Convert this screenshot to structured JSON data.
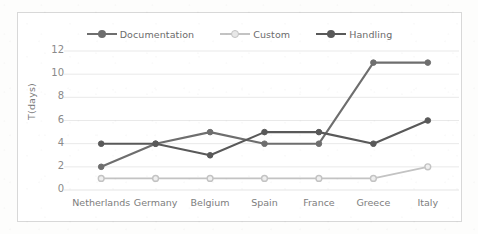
{
  "chart_data": {
    "type": "line",
    "title": "",
    "xlabel": "",
    "ylabel": "T(days)",
    "ylim": [
      0,
      12
    ],
    "yticks": [
      0,
      2,
      4,
      6,
      8,
      10,
      12
    ],
    "grid": true,
    "legend_position": "top",
    "categories": [
      "Netherlands",
      "Germany",
      "Belgium",
      "Spain",
      "France",
      "Greece",
      "Italy"
    ],
    "series": [
      {
        "name": "Documentation",
        "color": "#6e6e6e",
        "values": [
          2,
          4,
          5,
          4,
          4,
          11,
          11
        ]
      },
      {
        "name": "Custom",
        "color": "#c3c3c3",
        "values": [
          1,
          1,
          1,
          1,
          1,
          1,
          2
        ]
      },
      {
        "name": "Handling",
        "color": "#595959",
        "values": [
          4,
          4,
          3,
          5,
          5,
          4,
          6
        ]
      }
    ]
  },
  "legend": {
    "items": [
      {
        "label": "Documentation",
        "color": "#6e6e6e"
      },
      {
        "label": "Custom",
        "color": "#c3c3c3"
      },
      {
        "label": "Handling",
        "color": "#595959"
      }
    ]
  },
  "axes": {
    "y_title": "T(days)",
    "y_ticks": [
      "12",
      "10",
      "8",
      "6",
      "4",
      "2",
      "0"
    ],
    "x_ticks": [
      "Netherlands",
      "Germany",
      "Belgium",
      "Spain",
      "France",
      "Greece",
      "Italy"
    ]
  },
  "colors": {
    "grid": "#e6e6e6",
    "border": "#d8d8d8",
    "tick_text": "#8a8a8a",
    "background": "#ffffff"
  }
}
